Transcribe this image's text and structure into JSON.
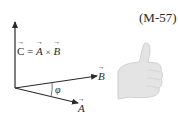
{
  "equation_number": "(M-57)",
  "equation": {
    "lhs": "C",
    "equals": "=",
    "operand_1": "A",
    "operator": "×",
    "operand_2": "B"
  },
  "vectors": {
    "c_label": "C",
    "b_label": "B",
    "a_label": "A"
  },
  "angle_label": "φ",
  "illustration": "right-hand-thumbs-up",
  "colors": {
    "ink": "#2a2a2a",
    "hand_fill": "#e4e4e4",
    "hand_stroke": "#c8c8c8"
  }
}
